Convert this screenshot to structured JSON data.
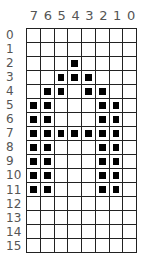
{
  "chart_data": {
    "type": "table",
    "title": "",
    "column_labels": [
      "7",
      "6",
      "5",
      "4",
      "3",
      "2",
      "1",
      "0"
    ],
    "row_labels": [
      "0",
      "1",
      "2",
      "3",
      "4",
      "5",
      "6",
      "7",
      "8",
      "9",
      "10",
      "11",
      "12",
      "13",
      "14",
      "15"
    ],
    "bitmap": [
      [
        0,
        0,
        0,
        0,
        0,
        0,
        0,
        0
      ],
      [
        0,
        0,
        0,
        0,
        0,
        0,
        0,
        0
      ],
      [
        0,
        0,
        0,
        1,
        0,
        0,
        0,
        0
      ],
      [
        0,
        0,
        1,
        1,
        1,
        0,
        0,
        0
      ],
      [
        0,
        1,
        1,
        0,
        1,
        1,
        0,
        0
      ],
      [
        1,
        1,
        0,
        0,
        0,
        1,
        1,
        0
      ],
      [
        1,
        1,
        0,
        0,
        0,
        1,
        1,
        0
      ],
      [
        1,
        1,
        1,
        1,
        1,
        1,
        1,
        0
      ],
      [
        1,
        1,
        0,
        0,
        0,
        1,
        1,
        0
      ],
      [
        1,
        1,
        0,
        0,
        0,
        1,
        1,
        0
      ],
      [
        1,
        1,
        0,
        0,
        0,
        1,
        1,
        0
      ],
      [
        1,
        1,
        0,
        0,
        0,
        1,
        1,
        0
      ],
      [
        0,
        0,
        0,
        0,
        0,
        0,
        0,
        0
      ],
      [
        0,
        0,
        0,
        0,
        0,
        0,
        0,
        0
      ],
      [
        0,
        0,
        0,
        0,
        0,
        0,
        0,
        0
      ],
      [
        0,
        0,
        0,
        0,
        0,
        0,
        0,
        0
      ]
    ],
    "hex_rows": [
      "00",
      "00",
      "10",
      "38",
      "6C",
      "C6",
      "C6",
      "FE",
      "C6",
      "C6",
      "C6",
      "C6",
      "00",
      "00",
      "00",
      "00"
    ],
    "depicted_character": "A"
  },
  "colors": {
    "pixel_on": "#000000",
    "grid_line": "#222222",
    "label": "#555555"
  }
}
